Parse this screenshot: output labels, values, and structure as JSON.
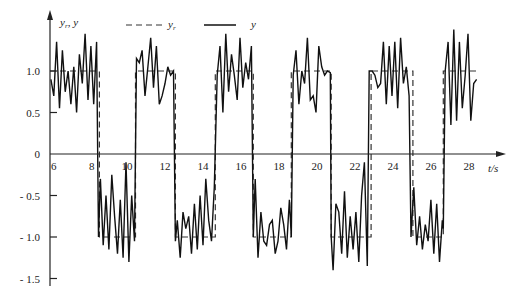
{
  "chart_data": {
    "type": "line",
    "title": "",
    "xlabel": "t/s",
    "ylabel": "y_r, y",
    "xlim": [
      5.5,
      29.5
    ],
    "ylim": [
      -1.6,
      1.5
    ],
    "grid": false,
    "legend_position": "top",
    "x_ticks": [
      6,
      8,
      10,
      12,
      14,
      16,
      18,
      20,
      22,
      24,
      26,
      28
    ],
    "x_tick_labels": [
      "6",
      "8",
      "10",
      "12",
      "14",
      "16",
      "18",
      "20",
      "22",
      "24",
      "26",
      "28"
    ],
    "y_ticks": [
      1.0,
      0.5,
      0,
      -0.5,
      -1.0,
      -1.5
    ],
    "y_tick_labels": [
      "1.0",
      "0.5",
      "0",
      "- 0.5",
      "- 1.0",
      "- 1.5"
    ],
    "legend": [
      {
        "name": "y_r",
        "label": "y",
        "subscript": "r",
        "style": "dashed"
      },
      {
        "name": "y",
        "label": "y",
        "subscript": "",
        "style": "solid"
      }
    ],
    "series": [
      {
        "name": "y_r",
        "style": "dashed",
        "color": "#333333",
        "x": [
          5.5,
          8.1,
          8.1,
          10.0,
          10.0,
          12.1,
          12.1,
          14.2,
          14.2,
          16.2,
          16.2,
          18.2,
          18.2,
          20.3,
          20.3,
          22.4,
          22.4,
          24.6,
          24.6,
          26.2,
          26.2,
          28.0
        ],
        "y": [
          1.0,
          1.0,
          -1.0,
          -1.0,
          1.0,
          1.0,
          -1.0,
          -1.0,
          1.0,
          1.0,
          -1.0,
          -1.0,
          1.0,
          1.0,
          -1.0,
          -1.0,
          1.0,
          1.0,
          -1.0,
          -1.0,
          1.0,
          1.0
        ]
      },
      {
        "name": "y",
        "style": "solid",
        "color": "#111111",
        "x": [
          5.55,
          5.7,
          5.85,
          6.0,
          6.15,
          6.3,
          6.45,
          6.6,
          6.75,
          6.9,
          7.05,
          7.2,
          7.35,
          7.5,
          7.65,
          7.8,
          7.95,
          8.05,
          8.15,
          8.3,
          8.45,
          8.6,
          8.75,
          8.9,
          9.05,
          9.2,
          9.35,
          9.5,
          9.65,
          9.8,
          9.95,
          10.05,
          10.2,
          10.35,
          10.5,
          10.65,
          10.8,
          10.95,
          11.1,
          11.25,
          11.4,
          11.55,
          11.7,
          11.85,
          12.0,
          12.1,
          12.2,
          12.35,
          12.5,
          12.65,
          12.8,
          12.95,
          13.1,
          13.25,
          13.4,
          13.55,
          13.7,
          13.85,
          14.0,
          14.15,
          14.3,
          14.45,
          14.6,
          14.75,
          14.9,
          15.05,
          15.2,
          15.35,
          15.5,
          15.65,
          15.8,
          15.95,
          16.1,
          16.2,
          16.3,
          16.45,
          16.6,
          16.75,
          16.9,
          17.05,
          17.2,
          17.35,
          17.5,
          17.65,
          17.8,
          17.95,
          18.1,
          18.2,
          18.3,
          18.45,
          18.6,
          18.75,
          18.9,
          19.05,
          19.2,
          19.35,
          19.5,
          19.65,
          19.8,
          19.95,
          20.1,
          20.25,
          20.3,
          20.4,
          20.55,
          20.7,
          20.85,
          21.0,
          21.15,
          21.3,
          21.45,
          21.6,
          21.75,
          21.9,
          22.05,
          22.2,
          22.3,
          22.45,
          22.6,
          22.75,
          22.9,
          23.05,
          23.2,
          23.35,
          23.5,
          23.65,
          23.8,
          23.95,
          24.1,
          24.25,
          24.4,
          24.5,
          24.65,
          24.8,
          24.95,
          25.1,
          25.25,
          25.4,
          25.55,
          25.7,
          25.85,
          26.0,
          26.15,
          26.2,
          26.3,
          26.45,
          26.6,
          26.75,
          26.9,
          27.05,
          27.2,
          27.35,
          27.5,
          27.65,
          27.8,
          27.95
        ],
        "y": [
          0.9,
          0.7,
          1.35,
          0.55,
          1.25,
          0.75,
          1.0,
          0.6,
          1.05,
          0.5,
          1.2,
          0.85,
          1.45,
          0.65,
          1.3,
          0.6,
          1.35,
          -1.0,
          -0.3,
          -1.1,
          -0.5,
          -1.15,
          -0.25,
          -0.75,
          -1.2,
          -0.55,
          -1.25,
          -0.1,
          -1.3,
          -0.5,
          -1.05,
          1.15,
          1.1,
          1.25,
          0.7,
          1.05,
          1.4,
          0.8,
          1.3,
          0.6,
          0.7,
          0.85,
          1.05,
          0.95,
          1.0,
          -1.05,
          -0.8,
          -1.25,
          -0.7,
          -0.9,
          -0.75,
          -1.2,
          -0.6,
          -1.15,
          -0.5,
          -1.1,
          -0.3,
          -0.8,
          -1.05,
          -0.4,
          0.95,
          1.3,
          0.5,
          1.45,
          0.75,
          1.2,
          0.95,
          0.65,
          1.4,
          0.8,
          1.1,
          0.9,
          1.3,
          -1.0,
          -0.3,
          -1.25,
          -0.7,
          -1.05,
          -1.1,
          -0.85,
          -0.8,
          -1.2,
          -1.05,
          -0.65,
          -0.85,
          -1.15,
          -0.55,
          -1.0,
          0.95,
          1.25,
          0.6,
          1.0,
          0.85,
          1.4,
          0.65,
          0.7,
          0.5,
          1.3,
          1.05,
          0.95,
          1.0,
          0.98,
          -1.0,
          -1.4,
          -0.6,
          -0.7,
          -1.2,
          -0.45,
          -1.25,
          -0.75,
          -1.15,
          -0.7,
          -1.3,
          -0.5,
          -0.1,
          -1.35,
          1.0,
          1.0,
          0.95,
          0.8,
          0.85,
          1.35,
          0.6,
          1.3,
          0.7,
          1.35,
          0.55,
          1.4,
          0.85,
          1.05,
          0.7,
          -1.0,
          -0.4,
          -1.1,
          -0.75,
          -1.15,
          -0.85,
          -1.05,
          -0.55,
          -1.2,
          -0.6,
          -1.3,
          -0.8,
          -0.9,
          1.0,
          1.35,
          0.35,
          1.5,
          0.4,
          1.35,
          0.55,
          0.95,
          1.45,
          0.4,
          0.85,
          0.9
        ]
      }
    ]
  }
}
